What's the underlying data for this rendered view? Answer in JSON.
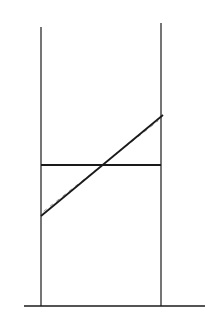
{
  "diagram": {
    "width": 212,
    "height": 317,
    "background": "#ffffff",
    "ink": "#1a1a1a",
    "dash_ink": "#8a8a8a",
    "baseline": {
      "x1": 24,
      "y1": 306,
      "x2": 205,
      "y2": 306,
      "stroke_width": 1.6
    },
    "left_vertical": {
      "x1": 41,
      "y1": 27,
      "x2": 41,
      "y2": 306,
      "stroke_width": 1.2
    },
    "right_vertical": {
      "x1": 161,
      "y1": 23,
      "x2": 161,
      "y2": 306,
      "stroke_width": 1.2
    },
    "horizontal": {
      "x1": 41,
      "y1": 165,
      "x2": 161,
      "y2": 165,
      "stroke_width": 1.8
    },
    "solid_diagonal": {
      "x1": 41,
      "y1": 216,
      "x2": 163,
      "y2": 115,
      "stroke_width": 1.8
    },
    "dashed_diagonal": {
      "x1": 44,
      "y1": 211,
      "x2": 158,
      "y2": 121,
      "stroke_width": 0.9,
      "dasharray": "3 5"
    }
  }
}
